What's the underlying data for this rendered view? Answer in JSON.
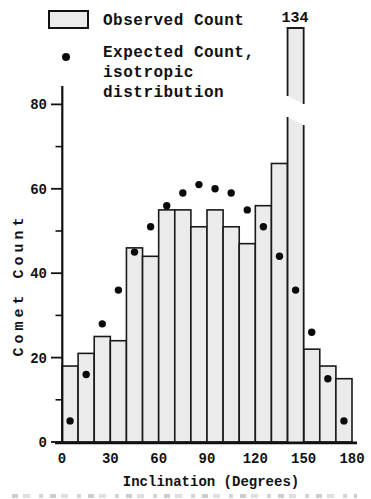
{
  "legend": {
    "observed_label": "Observed Count",
    "expected_lines": [
      "Expected Count,",
      "isotropic",
      "distribution"
    ]
  },
  "axes": {
    "x_title": "Inclination (Degrees)",
    "y_title": "Comet Count"
  },
  "chart_data": {
    "type": "bar",
    "title": "",
    "xlabel": "Inclination (Degrees)",
    "ylabel": "Comet Count",
    "bin_edges_degrees": [
      0,
      10,
      20,
      30,
      40,
      50,
      60,
      70,
      80,
      90,
      100,
      110,
      120,
      130,
      140,
      150,
      160,
      170,
      180
    ],
    "series": [
      {
        "name": "Observed Count",
        "render": "bar",
        "values": [
          18,
          21,
          25,
          24,
          46,
          44,
          55,
          55,
          51,
          55,
          51,
          47,
          56,
          66,
          134,
          22,
          18,
          15
        ]
      },
      {
        "name": "Expected Count, isotropic distribution",
        "render": "scatter",
        "values": [
          5,
          16,
          28,
          36,
          45,
          51,
          56,
          59,
          61,
          60,
          59,
          55,
          51,
          44,
          36,
          26,
          15,
          5
        ]
      }
    ],
    "x_ticks": [
      0,
      30,
      60,
      90,
      120,
      150,
      180
    ],
    "y_ticks_major": [
      0,
      20,
      40,
      60,
      80
    ],
    "y_ticks_minor": [
      10,
      30,
      50,
      70
    ],
    "xlim": [
      0,
      180
    ],
    "ylim": [
      0,
      85
    ],
    "axis_break": {
      "series": "Observed Count",
      "bin_range_degrees": [
        140,
        150
      ],
      "bin_index": 14,
      "value": 134,
      "label": "134"
    },
    "legend_position": "top-left",
    "grid": false,
    "colors": {
      "bar_fill": "#ebebeb",
      "bar_border": "#1a1a1a",
      "dot": "#0a0a0a",
      "axis": "#111111",
      "text": "#111111"
    }
  }
}
